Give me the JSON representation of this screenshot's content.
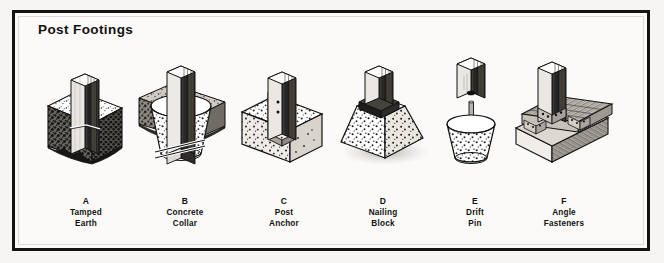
{
  "plate": {
    "title": "Post Footings",
    "border_color": "#131313",
    "background_color": "#fbfaf8",
    "ink_color": "#111111"
  },
  "figures": [
    {
      "letter": "A",
      "caption_line1": "Tamped",
      "caption_line2": "Earth",
      "name": "tamped-earth",
      "description": "Wood post set in hole with tamped earth backfill, cutaway earth block",
      "materials": [
        "wood post",
        "tamped earth",
        "soil cutaway"
      ]
    },
    {
      "letter": "B",
      "caption_line1": "Concrete",
      "caption_line2": "Collar",
      "name": "concrete-collar",
      "description": "Wood post with tapered concrete collar poured around it in earth",
      "materials": [
        "wood post",
        "concrete collar",
        "earth cutaway",
        "drift rod"
      ]
    },
    {
      "letter": "C",
      "caption_line1": "Post",
      "caption_line2": "Anchor",
      "name": "post-anchor",
      "description": "Metal post anchor strap with bolt holes embedded in concrete block",
      "materials": [
        "wood post",
        "metal anchor strap",
        "concrete block"
      ]
    },
    {
      "letter": "D",
      "caption_line1": "Nailing",
      "caption_line2": "Block",
      "name": "nailing-block",
      "description": "Tapered concrete pier with wood nailing block cast into top",
      "materials": [
        "wood post",
        "nailing block",
        "tapered concrete pier"
      ]
    },
    {
      "letter": "E",
      "caption_line1": "Drift",
      "caption_line2": "Pin",
      "name": "drift-pin",
      "description": "Exploded view of post with drilled hole above pier with drift pin",
      "materials": [
        "wood post",
        "drift pin",
        "tapered concrete pier"
      ]
    },
    {
      "letter": "F",
      "caption_line1": "Angle",
      "caption_line2": "Fasteners",
      "name": "angle-fasteners",
      "description": "Post fastened to timber sill beams with metal angle fasteners",
      "materials": [
        "wood post",
        "angle fasteners",
        "timber sill",
        "timber beam"
      ]
    }
  ]
}
